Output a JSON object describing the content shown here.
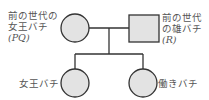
{
  "nodes": {
    "prev_queen": {
      "line1": "前の世代の",
      "line2": "女王バチ",
      "line3": "(PQ)",
      "shape": "circle"
    },
    "prev_male": {
      "line1": "前の世代",
      "line2": "の雄バチ",
      "line3": "(R)",
      "shape": "square"
    },
    "queen": {
      "label": "女王バチ",
      "shape": "circle"
    },
    "worker": {
      "label": "働きバチ",
      "shape": "circle"
    }
  },
  "colors": {
    "fill": "#e3e3e3",
    "stroke": "#333333",
    "text": "#555555"
  }
}
